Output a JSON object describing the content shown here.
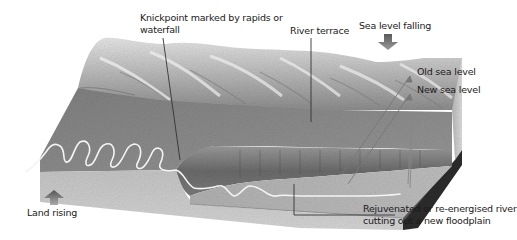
{
  "diagram": {
    "labels": {
      "knickpoint": "Knickpoint marked by rapids or waterfall",
      "knickpoint_line1": "Knickpoint marked by rapids or",
      "knickpoint_line2": "waterfall",
      "river_terrace": "River terrace",
      "sea_level_falling": "Sea level falling",
      "old_sea_level": "Old sea level",
      "new_sea_level": "New sea level",
      "land_rising": "Land rising",
      "rejuvenated_line1": "Rejuvenated or re-energised river",
      "rejuvenated_line2": "cutting out a new floodplain"
    },
    "arrows": {
      "sea_level_falling": "down-arrow",
      "land_rising": "up-arrow"
    },
    "colors": {
      "background": "#ffffff",
      "hills_light": "#d9d9d9",
      "hills_dark": "#8a8a8a",
      "old_floodplain": "#8e8e8e",
      "terrace_scarp": "#6e6e6e",
      "new_floodplain": "#b5b5b5",
      "front_face": "#c8c8c8",
      "side_face_dark": "#2a2a2a",
      "river": "#f4f4f4",
      "leader_line": "#333333",
      "arrow": "#6a6a6a",
      "text": "#1a1a1a"
    }
  }
}
